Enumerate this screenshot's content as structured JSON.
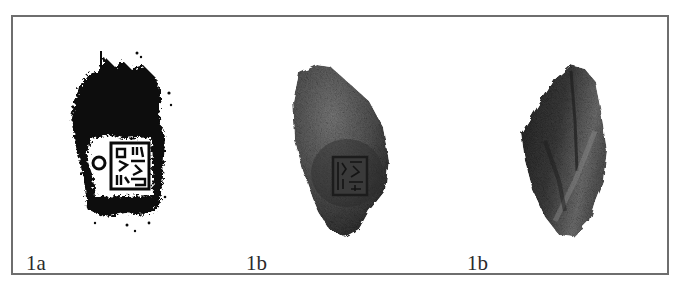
{
  "figure": {
    "panels": [
      {
        "label": "1a",
        "description": "seal impression rubbing"
      },
      {
        "label": "1b",
        "description": "clay sealing, front with stamped seal"
      },
      {
        "label": "1b",
        "description": "clay sealing, reverse"
      }
    ],
    "colors": {
      "frame": "#6e6e6e",
      "ink": "#0a0a0a",
      "clay_light": "#6a6a6a",
      "clay_dark": "#2e2e2e"
    }
  }
}
